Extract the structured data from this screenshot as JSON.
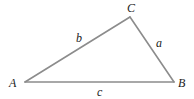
{
  "diagram": {
    "type": "triangle",
    "line_color": "#8c8c8c",
    "label_color": "#222222",
    "vertices": [
      {
        "name": "A",
        "label": "A",
        "x": 25,
        "y": 82
      },
      {
        "name": "B",
        "label": "B",
        "x": 174,
        "y": 82
      },
      {
        "name": "C",
        "label": "C",
        "x": 130,
        "y": 17
      }
    ],
    "sides": [
      {
        "name": "a",
        "label": "a",
        "from": "B",
        "to": "C"
      },
      {
        "name": "b",
        "label": "b",
        "from": "A",
        "to": "C"
      },
      {
        "name": "c",
        "label": "c",
        "from": "A",
        "to": "B"
      }
    ]
  }
}
